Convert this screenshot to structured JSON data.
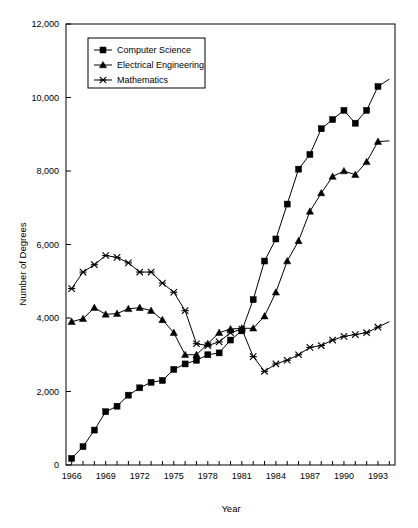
{
  "chart_data": {
    "type": "line",
    "title": "",
    "xlabel": "Year",
    "ylabel": "Number of Degrees",
    "xlim": [
      1965.5,
      1994.5
    ],
    "ylim": [
      0,
      12000
    ],
    "grid": false,
    "legend_position": "top-left",
    "y_ticks": [
      0,
      2000,
      4000,
      6000,
      8000,
      10000,
      12000
    ],
    "y_tick_labels": [
      "0",
      "2,000",
      "4,000",
      "6,000",
      "8,000",
      "10,000",
      "12,000"
    ],
    "x_ticks": [
      1966,
      1967,
      1968,
      1969,
      1970,
      1971,
      1972,
      1973,
      1974,
      1975,
      1976,
      1977,
      1978,
      1979,
      1980,
      1981,
      1982,
      1983,
      1984,
      1985,
      1986,
      1987,
      1988,
      1989,
      1990,
      1991,
      1992,
      1993,
      1994
    ],
    "x_tick_labels": [
      "1966",
      "",
      "",
      "1969",
      "",
      "",
      "1972",
      "",
      "",
      "1975",
      "",
      "",
      "1978",
      "",
      "",
      "1981",
      "",
      "",
      "1984",
      "",
      "",
      "1987",
      "",
      "",
      "1990",
      "",
      "",
      "1993",
      ""
    ],
    "x": [
      1966,
      1967,
      1968,
      1969,
      1970,
      1971,
      1972,
      1973,
      1974,
      1975,
      1976,
      1977,
      1978,
      1979,
      1980,
      1981,
      1982,
      1983,
      1984,
      1985,
      1986,
      1987,
      1988,
      1989,
      1990,
      1991,
      1992,
      1993,
      1994
    ],
    "series": [
      {
        "name": "Computer Science",
        "marker": "square",
        "values": [
          180,
          500,
          950,
          1450,
          1600,
          1900,
          2100,
          2250,
          2300,
          2600,
          2750,
          2850,
          3000,
          3050,
          3400,
          3650,
          4500,
          5550,
          6150,
          7100,
          8050,
          8450,
          9150,
          9400,
          9650,
          9300,
          9650,
          10300,
          10500
        ]
      },
      {
        "name": "Electrical Engineering",
        "marker": "triangle",
        "values": [
          3900,
          3980,
          4280,
          4100,
          4120,
          4250,
          4280,
          4200,
          3950,
          3600,
          3000,
          3000,
          3300,
          3600,
          3700,
          3720,
          3720,
          4050,
          4700,
          5550,
          6100,
          6900,
          7400,
          7850,
          8000,
          7900,
          8250,
          8800,
          8820
        ]
      },
      {
        "name": "Mathematics",
        "marker": "x",
        "values": [
          4800,
          5250,
          5450,
          5700,
          5650,
          5500,
          5250,
          5250,
          4950,
          4700,
          4200,
          3300,
          3250,
          3350,
          3600,
          3700,
          2950,
          2550,
          2750,
          2850,
          3000,
          3200,
          3250,
          3400,
          3500,
          3550,
          3600,
          3750,
          3900
        ]
      }
    ]
  },
  "legend": {
    "items": [
      {
        "label": "Computer Science",
        "marker": "square"
      },
      {
        "label": "Electrical Engineering",
        "marker": "triangle"
      },
      {
        "label": "Mathematics",
        "marker": "x"
      }
    ]
  },
  "axes": {
    "x_title": "Year",
    "y_title": "Number of Degrees"
  }
}
